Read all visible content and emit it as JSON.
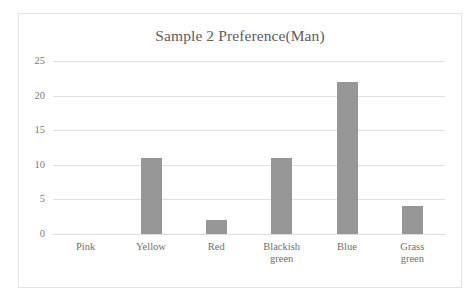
{
  "chart_data": {
    "type": "bar",
    "title": "Sample 2 Preference(Man)",
    "xlabel": "",
    "ylabel": "",
    "categories": [
      "Pink",
      "Yellow",
      "Red",
      "Blackish green",
      "Blue",
      "Grass green"
    ],
    "category_display": [
      "Pink",
      "Yellow",
      "Red",
      "Blackish\ngreen",
      "Blue",
      "Grass green"
    ],
    "values": [
      0,
      11,
      2,
      11,
      22,
      4
    ],
    "ylim": [
      0,
      25
    ],
    "yticks": [
      0,
      5,
      10,
      15,
      20,
      25
    ],
    "ytick_labels": [
      "0",
      "5",
      "10",
      "15",
      "20",
      "25"
    ],
    "grid": true,
    "legend": false,
    "bar_color": "#969696",
    "gridline_color": "#e0e0e0",
    "title_color": "#5d5d5d",
    "tick_label_color": "#7b7b7b",
    "border_color": "#e3e3e3",
    "background_color": "#ffffff"
  }
}
